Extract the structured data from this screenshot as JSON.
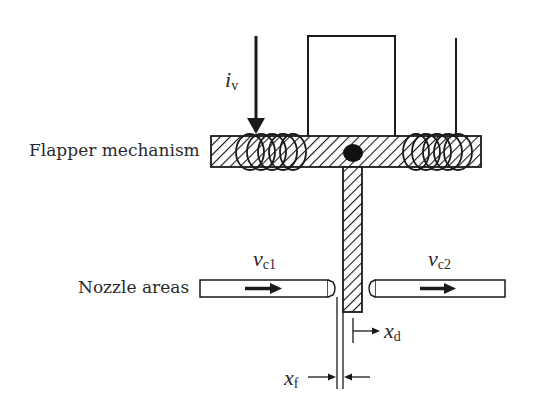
{
  "diagram": {
    "labels": {
      "flapper": "Flapper mechanism",
      "nozzle": "Nozzle areas"
    },
    "symbols": {
      "current": {
        "main": "i",
        "sub": "v"
      },
      "vc1": {
        "main": "v",
        "sub": "c1"
      },
      "vc2": {
        "main": "v",
        "sub": "c2"
      },
      "xd": {
        "main": "x",
        "sub": "d"
      },
      "xf": {
        "main": "x",
        "sub": "f"
      }
    },
    "colors": {
      "stroke": "#1a1a1a",
      "background": "#ffffff"
    }
  }
}
